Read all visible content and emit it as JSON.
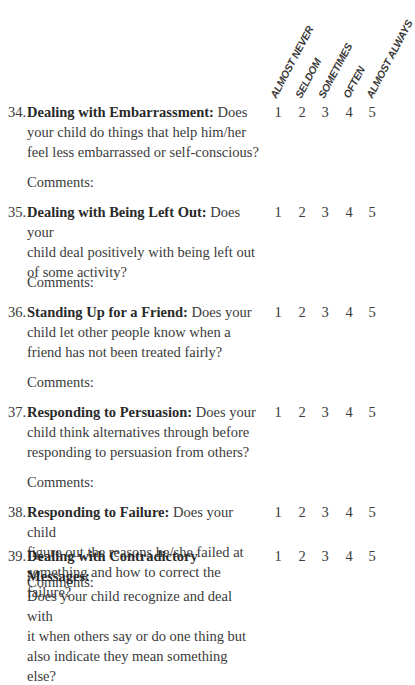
{
  "scale_headers": [
    "ALMOST NEVER",
    "SELDOM",
    "SOMETIMES",
    "OFTEN",
    "ALMOST ALWAYS"
  ],
  "scale_values": [
    "1",
    "2",
    "3",
    "4",
    "5"
  ],
  "comments_label": "Comments:",
  "questions": [
    {
      "number": "34.",
      "title": "Dealing with Embarrassment:",
      "body_line1": " Does",
      "lines": [
        "your child do things that help him/her",
        "feel less embarrassed or self-conscious?"
      ]
    },
    {
      "number": "35.",
      "title": "Dealing with Being Left Out:",
      "body_line1": " Does your",
      "lines": [
        "child deal positively with being left out",
        "of some activity?"
      ]
    },
    {
      "number": "36.",
      "title": "Standing Up for a Friend:",
      "body_line1": " Does your",
      "lines": [
        "child let other people know when a",
        "friend has not been treated fairly?"
      ]
    },
    {
      "number": "37.",
      "title": "Responding to Persuasion:",
      "body_line1": " Does your",
      "lines": [
        "child think alternatives through before",
        "responding to persuasion from others?"
      ]
    },
    {
      "number": "38.",
      "title": "Responding to Failure:",
      "body_line1": " Does your child",
      "lines": [
        "figure out the reasons he/she failed at",
        "something and how to correct the failure?"
      ]
    },
    {
      "number": "39.",
      "title": "Dealing with Contradictory Messages:",
      "body_line1": "",
      "lines": [
        "Does your child recognize and deal with",
        "it when others say or do one thing but",
        "also indicate they mean something else?"
      ]
    }
  ]
}
